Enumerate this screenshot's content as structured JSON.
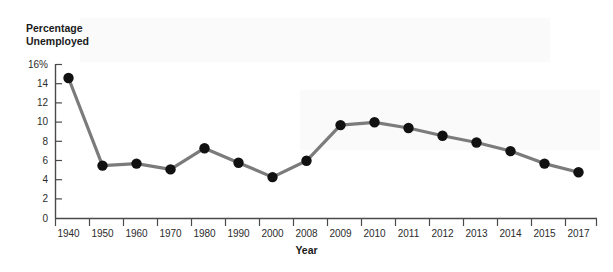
{
  "figure": {
    "cropped_header_text": "",
    "y_axis_title_line1": "Percentage",
    "y_axis_title_line2": "Unemployed",
    "x_axis_title": "Year",
    "line_color": "#7b7b7b",
    "marker_color": "#111111",
    "axis_color": "#4a4a4a",
    "background": "#ffffff"
  },
  "chart_data": {
    "type": "line",
    "title": "",
    "subtitle": "",
    "xlabel": "Year",
    "ylabel": "Percentage Unemployed",
    "categories": [
      "1940",
      "1950",
      "1960",
      "1970",
      "1980",
      "1990",
      "2000",
      "2008",
      "2009",
      "2010",
      "2011",
      "2012",
      "2013",
      "2014",
      "2015",
      "2017"
    ],
    "values": [
      14.6,
      5.5,
      5.7,
      5.1,
      7.3,
      5.8,
      4.3,
      6.0,
      9.7,
      10.0,
      9.4,
      8.6,
      7.9,
      7.0,
      5.7,
      4.8
    ],
    "ytick_labels": [
      "16%",
      "14",
      "12",
      "10",
      "8",
      "6",
      "4",
      "2",
      "0"
    ],
    "ytick_values": [
      16,
      14,
      12,
      10,
      8,
      6,
      4,
      2,
      0
    ],
    "ylim": [
      0,
      16
    ],
    "grid": false,
    "legend": null,
    "markers": "filled-circle",
    "series": [
      {
        "name": "Percentage Unemployed",
        "values": [
          14.6,
          5.5,
          5.7,
          5.1,
          7.3,
          5.8,
          4.3,
          6.0,
          9.7,
          10.0,
          9.4,
          8.6,
          7.9,
          7.0,
          5.7,
          4.8
        ]
      }
    ]
  }
}
